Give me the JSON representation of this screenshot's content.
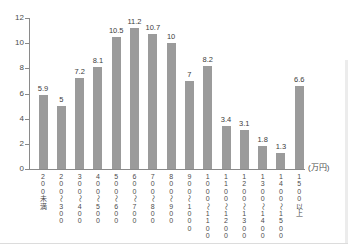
{
  "chart_data": {
    "type": "bar",
    "title": "",
    "xlabel": "",
    "ylabel": "",
    "unit_label": "(万円)",
    "categories": [
      "200未満",
      "200〜300",
      "300〜400",
      "400〜500",
      "500〜600",
      "600〜700",
      "700〜800",
      "800〜900",
      "900〜1000",
      "1000〜1100",
      "1100〜1200",
      "1200〜1300",
      "1300〜1400",
      "1400〜1500",
      "1500以上"
    ],
    "values": [
      5.9,
      5,
      7.2,
      8.1,
      10.5,
      11.2,
      10.7,
      10,
      7,
      8.2,
      3.4,
      3.1,
      1.8,
      1.3,
      6.6
    ],
    "value_labels": [
      "5.9",
      "5",
      "7.2",
      "8.1",
      "10.5",
      "11.2",
      "10.7",
      "10",
      "7",
      "8.2",
      "3.4",
      "3.1",
      "1.8",
      "1.3",
      "6.6"
    ],
    "yticks": [
      0,
      2,
      4,
      6,
      8,
      10,
      12
    ],
    "ylim": [
      0,
      12
    ],
    "grid": false,
    "legend": "none",
    "colors": {
      "bar": "#9b9b9b",
      "axis": "#8a8a8a",
      "value_text": "#3c3c3c",
      "tick_text": "#4c4c4c"
    }
  }
}
